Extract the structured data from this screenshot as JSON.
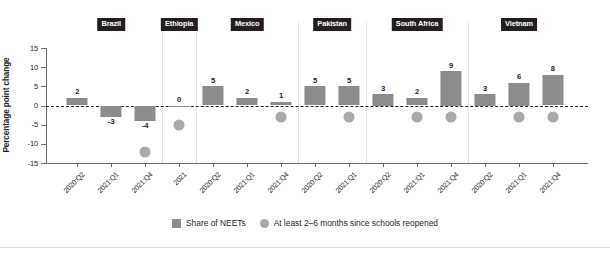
{
  "chart_data": {
    "type": "bar",
    "title": "",
    "xlabel": "",
    "ylabel": "Percentage point change",
    "ylim": [
      -15,
      15
    ],
    "yticks": [
      15,
      10,
      5,
      0,
      -5,
      -10,
      -15
    ],
    "ytick_labels": [
      "15",
      "10",
      "5",
      "0",
      "-5",
      "-10",
      "-15"
    ],
    "grid": false,
    "zero_reference_line": true,
    "legend_position": "bottom-center",
    "groups": [
      "Brazil",
      "Ethiopia",
      "Mexico",
      "Pakistan",
      "South Africa",
      "Vietnam"
    ],
    "categories": [
      "2020:Q2",
      "2021:Q1",
      "2021:Q4",
      "2021",
      "2020:Q2",
      "2021:Q1",
      "2021:Q4",
      "2020:Q2",
      "2021:Q1",
      "2020:Q2",
      "2021:Q1",
      "2021:Q4",
      "2020:Q2",
      "2021:Q1",
      "2021:Q4"
    ],
    "series": [
      {
        "name": "Share of NEETs",
        "type": "bar",
        "color": "#8a8c8e",
        "values": [
          2,
          -3,
          -4,
          0,
          5,
          2,
          1,
          5,
          5,
          3,
          2,
          9,
          3,
          6,
          8
        ],
        "labels": [
          "2",
          "-3",
          "-4",
          "0",
          "5",
          "2",
          "1",
          "5",
          "5",
          "3",
          "2",
          "9",
          "3",
          "6",
          "8"
        ]
      },
      {
        "name": "At least 2-6 months since schools reopened",
        "type": "scatter",
        "color": "#a7a9ac",
        "values": [
          null,
          null,
          -12.2,
          -5.2,
          null,
          null,
          -3.1,
          null,
          -3.1,
          null,
          -3.1,
          -3.1,
          null,
          -3.1,
          -3.1
        ]
      }
    ],
    "group_spans": [
      {
        "group": "Brazil",
        "start_index": 0,
        "end_index": 2
      },
      {
        "group": "Ethiopia",
        "start_index": 3,
        "end_index": 3
      },
      {
        "group": "Mexico",
        "start_index": 4,
        "end_index": 6
      },
      {
        "group": "Pakistan",
        "start_index": 7,
        "end_index": 8
      },
      {
        "group": "South Africa",
        "start_index": 9,
        "end_index": 11
      },
      {
        "group": "Vietnam",
        "start_index": 12,
        "end_index": 14
      }
    ]
  },
  "legend": {
    "items": [
      {
        "label": "Share of NEETs",
        "marker": "square",
        "color": "#8a8c8e"
      },
      {
        "label": "At least 2–6 months since schools reopened",
        "marker": "circle",
        "color": "#a7a9ac"
      }
    ]
  },
  "axis": {
    "y_title": "Percentage point change"
  },
  "colors": {
    "bar": "#8a8c8e",
    "dot": "#a7a9ac",
    "text": "#231f20",
    "axis": "#6d6e71",
    "divider": "#c9c9c9",
    "pill_bg": "#231f20",
    "pill_text": "#ffffff"
  }
}
